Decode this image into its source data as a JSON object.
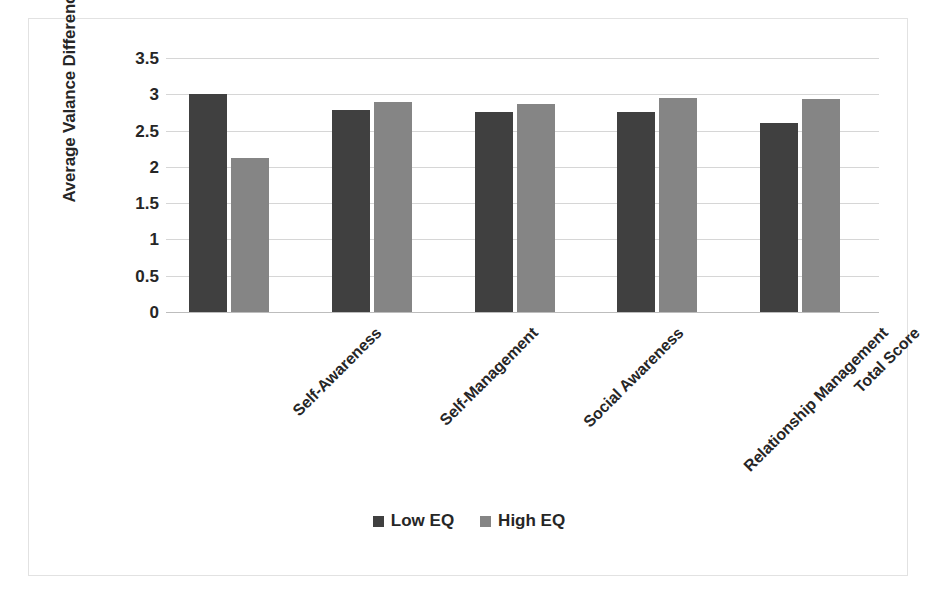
{
  "chart_data": {
    "type": "bar",
    "title": "",
    "xlabel": "",
    "ylabel": "Average Valance Difference",
    "categories": [
      "Self-Awareness",
      "Self-Management",
      "Social Awareness",
      "Relationship Management",
      "Total Score"
    ],
    "series": [
      {
        "name": "Low EQ",
        "color": "#404040",
        "values": [
          3.0,
          2.79,
          2.75,
          2.75,
          2.6
        ]
      },
      {
        "name": "High EQ",
        "color": "#858585",
        "values": [
          2.12,
          2.89,
          2.86,
          2.95,
          2.93
        ]
      }
    ],
    "ylim": [
      0,
      3.5
    ],
    "ytick_labels": [
      "3.5",
      "3",
      "2.5",
      "2",
      "1.5",
      "1",
      "0.5",
      "0"
    ],
    "ytick_values": [
      3.5,
      3,
      2.5,
      2,
      1.5,
      1,
      0.5,
      0
    ],
    "grid": true,
    "legend_position": "bottom",
    "x_label_rotation": -45
  },
  "legend": {
    "items": [
      {
        "label": "Low EQ",
        "color": "#404040"
      },
      {
        "label": "High EQ",
        "color": "#858585"
      }
    ]
  },
  "colors": {
    "low_eq": "#404040",
    "high_eq": "#858585",
    "gridline": "#d6d6d6",
    "frame_border": "#e2e2e2",
    "text": "#262626",
    "background": "#ffffff"
  }
}
